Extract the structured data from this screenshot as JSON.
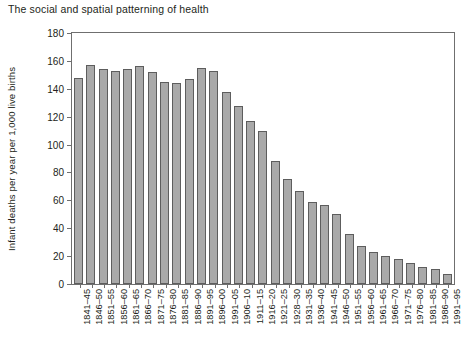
{
  "title": "The social and spatial patterning of health",
  "chart_data": {
    "type": "bar",
    "title": "The social and spatial patterning of health",
    "xlabel": "",
    "ylabel": "Infant deaths per year per 1,000 live births",
    "ylim": [
      0,
      180
    ],
    "yticks": [
      0,
      20,
      40,
      60,
      80,
      100,
      120,
      140,
      160,
      180
    ],
    "grid": false,
    "legend": null,
    "bar_color": "#a9a9a9",
    "bar_edge_color": "#5d5d5d",
    "categories": [
      "1841–45",
      "1846–50",
      "1851–55",
      "1856–60",
      "1861–65",
      "1866–70",
      "1871–75",
      "1876–80",
      "1881–85",
      "1886–90",
      "1891–95",
      "1896–00",
      "1991–05",
      "1906–10",
      "1911–15",
      "1916–20",
      "1921–25",
      "1928–30",
      "1931–35",
      "1936–40",
      "1941–45",
      "1946–50",
      "1951–55",
      "1956–60",
      "1961–65",
      "1966–70",
      "1971–75",
      "1976–80",
      "1981–85",
      "1986–90",
      "1991–95"
    ],
    "values": [
      148,
      157,
      154,
      153,
      154,
      156,
      152,
      145,
      144,
      147,
      155,
      153,
      138,
      128,
      117,
      110,
      88,
      75,
      67,
      59,
      57,
      50,
      36,
      27,
      23,
      20,
      18,
      15,
      12,
      11,
      7
    ]
  }
}
